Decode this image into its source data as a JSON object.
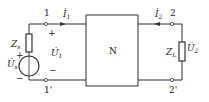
{
  "diagram": {
    "type": "two-port network circuit",
    "network_label": "N",
    "source": {
      "voltage_label": "U̇",
      "voltage_sub": "s",
      "impedance_label": "Z",
      "impedance_sub": "s",
      "polarity_plus": "+",
      "polarity_minus": "−"
    },
    "port1": {
      "terminal_top": "1",
      "terminal_bottom": "1'",
      "current_label": "İ",
      "current_sub": "1",
      "voltage_label": "U̇",
      "voltage_sub": "1",
      "plus": "+",
      "minus": "−"
    },
    "port2": {
      "terminal_top": "2",
      "terminal_bottom": "2'",
      "current_label": "İ",
      "current_sub": "2",
      "voltage_label": "U̇",
      "voltage_sub": "2",
      "load_label": "Z",
      "load_sub": "L"
    },
    "colors": {
      "line": "#333333",
      "background": "#ffffff"
    }
  }
}
